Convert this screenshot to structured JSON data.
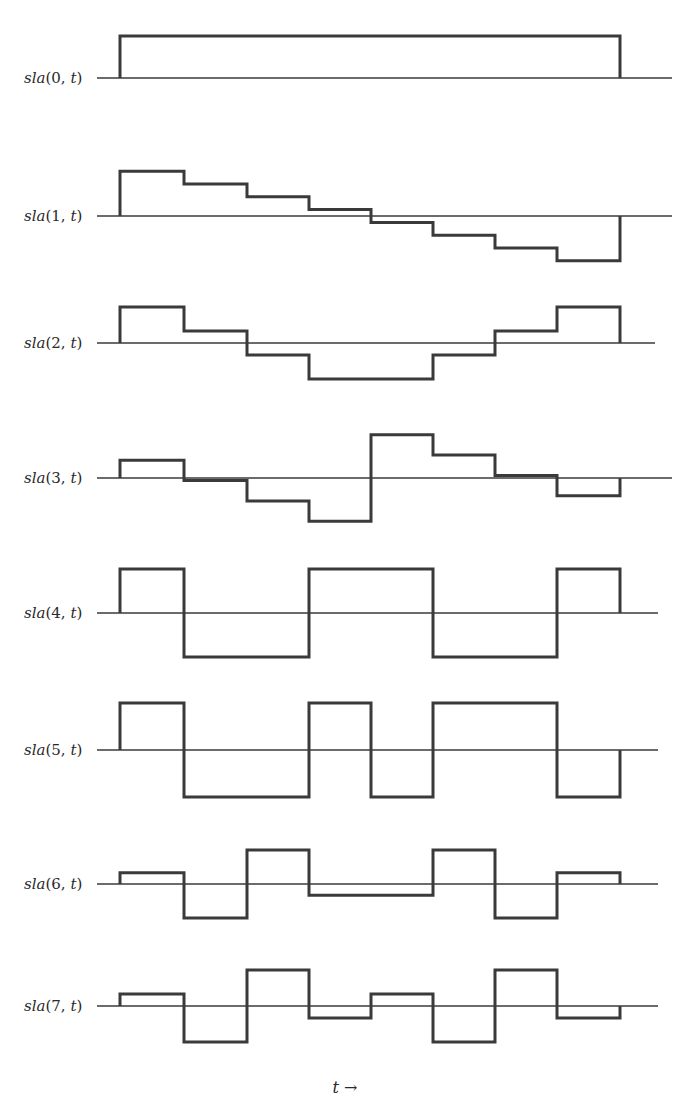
{
  "chart_data": {
    "type": "line",
    "subtype": "step",
    "title": "",
    "xlabel": "t →",
    "ylabel": "",
    "grid": false,
    "legend": "none",
    "x_segments": 8,
    "x_edges_px": [
      120,
      184,
      247,
      309,
      371,
      433,
      495,
      557,
      620
    ],
    "series": [
      {
        "name": "sla(0, t)",
        "values": [
          1,
          1,
          1,
          1,
          1,
          1,
          1,
          1
        ]
      },
      {
        "name": "sla(1, t)",
        "values": [
          7,
          5,
          3,
          1,
          -1,
          -3,
          -5,
          -7
        ]
      },
      {
        "name": "sla(2, t)",
        "values": [
          3,
          1,
          -1,
          -3,
          -3,
          -1,
          1,
          3
        ]
      },
      {
        "name": "sla(3, t)",
        "values": [
          7,
          -1,
          -9,
          -17,
          17,
          9,
          1,
          -7
        ]
      },
      {
        "name": "sla(4, t)",
        "values": [
          1,
          -1,
          -1,
          1,
          1,
          -1,
          -1,
          1
        ]
      },
      {
        "name": "sla(5, t)",
        "values": [
          1,
          -1,
          -1,
          1,
          -1,
          1,
          1,
          -1
        ]
      },
      {
        "name": "sla(6, t)",
        "values": [
          1,
          -3,
          3,
          -1,
          -1,
          3,
          -3,
          1
        ]
      },
      {
        "name": "sla(7, t)",
        "values": [
          1,
          -3,
          3,
          -1,
          1,
          -3,
          3,
          -1
        ]
      }
    ]
  },
  "rows": [
    {
      "label": "sla(0, t)",
      "baseline": 78,
      "scale": 42,
      "x_end": 672
    },
    {
      "label": "sla(1, t)",
      "baseline": 216,
      "scale": 6.4,
      "x_end": 672
    },
    {
      "label": "sla(2, t)",
      "baseline": 343,
      "scale": 12,
      "x_end": 655
    },
    {
      "label": "sla(3, t)",
      "baseline": 478,
      "scale": 2.55,
      "x_end": 672
    },
    {
      "label": "sla(4, t)",
      "baseline": 613,
      "scale": 44,
      "x_end": 658
    },
    {
      "label": "sla(5, t)",
      "baseline": 750,
      "scale": 47,
      "x_end": 658
    },
    {
      "label": "sla(6, t)",
      "baseline": 884,
      "scale": 11.3,
      "x_end": 658
    },
    {
      "label": "sla(7, t)",
      "baseline": 1006,
      "scale": 12,
      "x_end": 658
    }
  ],
  "axis": {
    "label": "t →"
  }
}
